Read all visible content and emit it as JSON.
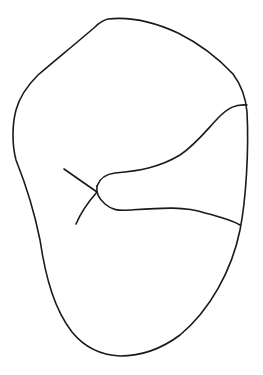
{
  "figure": {
    "type": "line-drawing",
    "stroke_color": "#1a1a1a",
    "background_color": "#ffffff",
    "labels": []
  }
}
